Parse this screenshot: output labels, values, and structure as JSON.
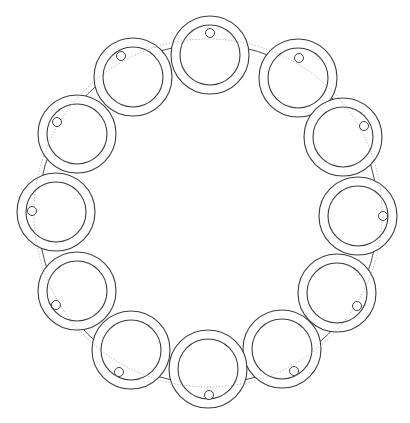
{
  "diagram": {
    "colors": {
      "stroke": "#3c3c3c",
      "dotted": "#9a9a9a",
      "background": "#ffffff"
    },
    "large_circle": {
      "cx": 208,
      "cy": 214,
      "r": 170
    },
    "dotted_circle": {
      "cx": 208,
      "cy": 213,
      "r": 174
    },
    "ring_outer_r": 39,
    "ring_inner_r": 30,
    "marker_r": 4.5,
    "rings": [
      {
        "id": 1,
        "cx": 210,
        "cy": 55,
        "marker": {
          "cx": 210,
          "cy": 33
        }
      },
      {
        "id": 2,
        "cx": 298,
        "cy": 78,
        "marker": {
          "cx": 299,
          "cy": 58
        }
      },
      {
        "id": 3,
        "cx": 343,
        "cy": 137,
        "marker": {
          "cx": 364,
          "cy": 126
        }
      },
      {
        "id": 4,
        "cx": 358,
        "cy": 216,
        "marker": {
          "cx": 383,
          "cy": 216
        }
      },
      {
        "id": 5,
        "cx": 337,
        "cy": 293,
        "marker": {
          "cx": 357,
          "cy": 306
        }
      },
      {
        "id": 6,
        "cx": 282,
        "cy": 349,
        "marker": {
          "cx": 294,
          "cy": 371
        }
      },
      {
        "id": 7,
        "cx": 208,
        "cy": 369,
        "marker": {
          "cx": 209,
          "cy": 395
        }
      },
      {
        "id": 8,
        "cx": 131,
        "cy": 350,
        "marker": {
          "cx": 119,
          "cy": 372
        }
      },
      {
        "id": 9,
        "cx": 77,
        "cy": 291,
        "marker": {
          "cx": 56,
          "cy": 305
        }
      },
      {
        "id": 10,
        "cx": 56,
        "cy": 212,
        "marker": {
          "cx": 32,
          "cy": 211
        }
      },
      {
        "id": 11,
        "cx": 77,
        "cy": 134,
        "marker": {
          "cx": 57,
          "cy": 122
        }
      },
      {
        "id": 12,
        "cx": 133,
        "cy": 77,
        "marker": {
          "cx": 121,
          "cy": 56
        }
      }
    ]
  }
}
